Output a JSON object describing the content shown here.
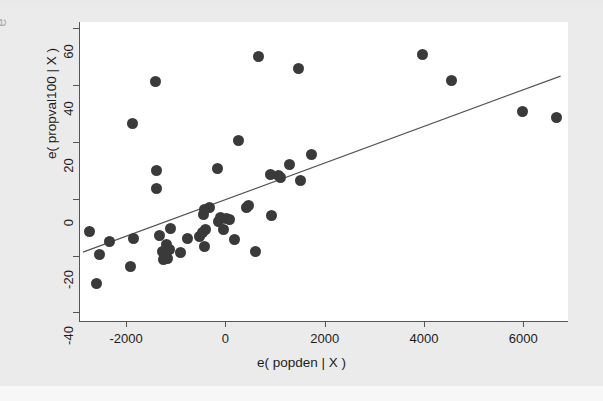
{
  "figure": {
    "background_color": "#ebebeb",
    "plot_background_color": "#ffffff",
    "marker_color": "#3a3a3a",
    "line_color": "#555555",
    "stray_margin_glyph": "e"
  },
  "chart_data": {
    "type": "scatter",
    "title": "",
    "subtitle": "",
    "xlabel": "e( popden | X )",
    "ylabel": "e( propval100 | X )",
    "xlim": [
      -2950,
      6900
    ],
    "ylim": [
      -43,
      62
    ],
    "xticks": [
      -2000,
      0,
      2000,
      4000,
      6000
    ],
    "xticklabels": [
      "-2000",
      "0",
      "2000",
      "4000",
      "6000"
    ],
    "yticks": [
      -40,
      -20,
      0,
      20,
      40,
      60
    ],
    "yticklabels": [
      "-40",
      "-20",
      "0",
      "20",
      "40",
      "60"
    ],
    "grid": false,
    "legend": null,
    "annotations": [],
    "series": [
      {
        "name": "residuals",
        "marker": "filled-circle",
        "marker_size_px": 11,
        "points": [
          [
            -2740,
            -11.5
          ],
          [
            -2600,
            -30.0
          ],
          [
            -2530,
            -19.5
          ],
          [
            -2340,
            -15.0
          ],
          [
            -1910,
            -24.0
          ],
          [
            -1880,
            26.5
          ],
          [
            -1850,
            -14.0
          ],
          [
            -1400,
            41.0
          ],
          [
            -1390,
            10.0
          ],
          [
            -1380,
            3.5
          ],
          [
            -1330,
            -13.0
          ],
          [
            -1270,
            -18.5
          ],
          [
            -1250,
            -21.5
          ],
          [
            -1220,
            -19.5
          ],
          [
            -1180,
            -16.0
          ],
          [
            -1160,
            -21.0
          ],
          [
            -1130,
            -18.0
          ],
          [
            -1100,
            -10.5
          ],
          [
            -900,
            -19.0
          ],
          [
            -760,
            -14.0
          ],
          [
            -520,
            -13.5
          ],
          [
            -470,
            -12.0
          ],
          [
            -450,
            -5.5
          ],
          [
            -430,
            -17.0
          ],
          [
            -420,
            -4.0
          ],
          [
            -400,
            -11.0
          ],
          [
            -330,
            -3.0
          ],
          [
            -160,
            10.5
          ],
          [
            -130,
            -8.0
          ],
          [
            -90,
            -6.5
          ],
          [
            -40,
            -11.0
          ],
          [
            30,
            -7.0
          ],
          [
            90,
            -7.5
          ],
          [
            190,
            -14.5
          ],
          [
            260,
            20.5
          ],
          [
            420,
            -3.0
          ],
          [
            470,
            -2.5
          ],
          [
            600,
            -18.5
          ],
          [
            660,
            50.0
          ],
          [
            900,
            8.5
          ],
          [
            930,
            -6.0
          ],
          [
            1060,
            8.0
          ],
          [
            1100,
            7.5
          ],
          [
            1300,
            12.0
          ],
          [
            1480,
            45.5
          ],
          [
            1520,
            6.5
          ],
          [
            1740,
            15.5
          ],
          [
            3970,
            50.5
          ],
          [
            4550,
            41.5
          ],
          [
            5980,
            30.5
          ],
          [
            6670,
            28.5
          ]
        ]
      }
    ],
    "fit_line": {
      "name": "linear fit",
      "x_start": -2870,
      "y_start": -18.8,
      "x_end": 6750,
      "y_end": 43.0
    }
  }
}
